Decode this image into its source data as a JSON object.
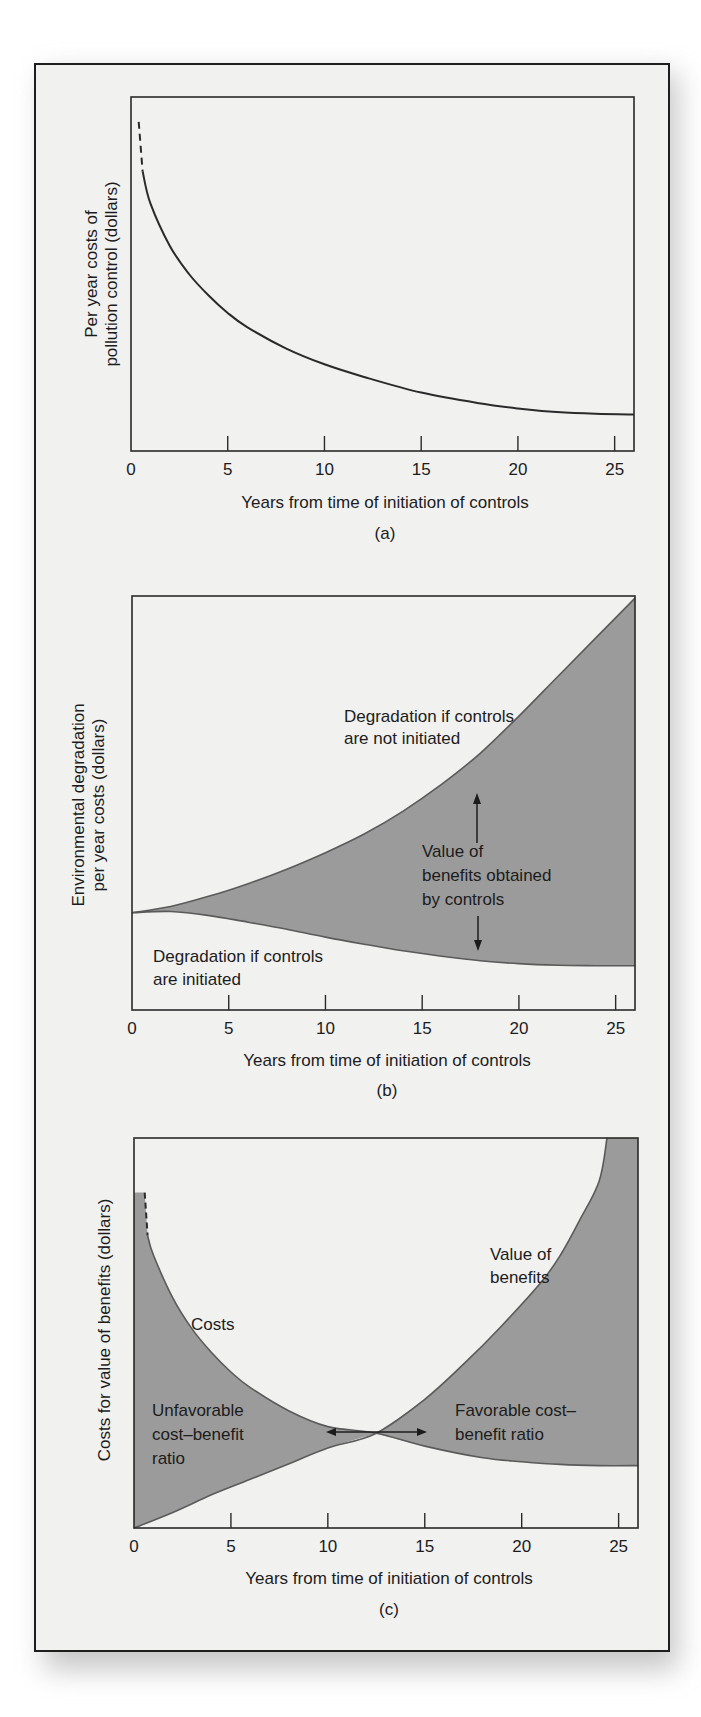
{
  "figure": {
    "background": "#f1f1f0",
    "fill_color": "#9b9b9b",
    "line_color": "#2a2a2a",
    "panels": [
      "(a)",
      "(b)",
      "(c)"
    ]
  },
  "chart_data": [
    {
      "type": "line",
      "panel": "(a)",
      "title": "",
      "xlabel": "Years from time of initiation of controls",
      "ylabel": [
        "Per year costs of",
        "pollution control (dollars)"
      ],
      "xticks": [
        0,
        5,
        10,
        15,
        20,
        25
      ],
      "xlim": [
        0,
        26
      ],
      "ylim": [
        0,
        100
      ],
      "grid": false,
      "caption": "(a)",
      "series": [
        {
          "name": "Per year costs of pollution control",
          "dashed_segment": {
            "x": [
              0.4,
              0.6
            ],
            "y": [
              93,
              79
            ]
          },
          "x": [
            0.6,
            1,
            2,
            3,
            4,
            5,
            6,
            8,
            10,
            12,
            15,
            18,
            20,
            22,
            24,
            26
          ],
          "y": [
            79,
            70,
            58,
            50,
            44,
            39,
            35,
            29,
            24.5,
            21,
            16.5,
            13.5,
            12,
            11,
            10.5,
            10.3
          ]
        }
      ]
    },
    {
      "type": "area",
      "panel": "(b)",
      "title": "",
      "xlabel": "Years from time of initiation of controls",
      "ylabel": [
        "Environmental degradation",
        "per year costs (dollars)"
      ],
      "xticks": [
        0,
        5,
        10,
        15,
        20,
        25
      ],
      "xlim": [
        0,
        26
      ],
      "ylim": [
        0,
        100
      ],
      "grid": false,
      "caption": "(b)",
      "series": [
        {
          "name": "Degradation if controls are not initiated",
          "x": [
            0,
            2,
            4,
            6,
            8,
            10,
            12,
            14,
            16,
            18,
            20,
            22,
            24,
            26
          ],
          "y": [
            23.5,
            25,
            27.5,
            30.5,
            34,
            38,
            42.5,
            48,
            54.5,
            62,
            71,
            80.5,
            90,
            99.5
          ]
        },
        {
          "name": "Degradation if controls are initiated",
          "x": [
            0,
            2,
            4,
            6,
            8,
            10,
            12,
            14,
            16,
            18,
            20,
            22,
            24,
            26
          ],
          "y": [
            23.5,
            23.8,
            22.8,
            21.2,
            19.5,
            17.6,
            15.9,
            14.3,
            13,
            11.9,
            11.2,
            10.8,
            10.7,
            10.7
          ]
        }
      ],
      "annotations": [
        {
          "text": [
            "Degradation if controls",
            "are not initiated"
          ]
        },
        {
          "text": [
            "Value of",
            "benefits obtained",
            "by controls"
          ]
        },
        {
          "text": [
            "Degradation if controls",
            "are initiated"
          ]
        }
      ]
    },
    {
      "type": "area",
      "panel": "(c)",
      "title": "",
      "xlabel": "Years from time of initiation of controls",
      "ylabel": [
        "Costs for value of benefits (dollars)"
      ],
      "xticks": [
        0,
        5,
        10,
        15,
        20,
        25
      ],
      "xlim": [
        0,
        26
      ],
      "ylim": [
        0,
        100
      ],
      "grid": false,
      "caption": "(c)",
      "series": [
        {
          "name": "Costs",
          "dashed_segment": {
            "x": [
              0.55,
              0.7
            ],
            "y": [
              86,
              75
            ]
          },
          "x": [
            0.7,
            1,
            2,
            3,
            4,
            5,
            6,
            8,
            10,
            12.5,
            15,
            18,
            20,
            22,
            24,
            26
          ],
          "y": [
            75,
            70,
            59,
            51,
            45,
            40,
            36,
            30,
            26,
            24.3,
            21,
            18,
            17,
            16.3,
            16,
            16
          ]
        },
        {
          "name": "Value of benefits",
          "x": [
            0,
            2,
            4,
            6,
            8,
            10,
            12.5,
            15,
            17,
            19,
            21,
            22,
            23,
            24,
            24.4
          ],
          "y": [
            0,
            4,
            8.5,
            12.5,
            16.5,
            20.5,
            24.3,
            33,
            42,
            52,
            63,
            70,
            79,
            89,
            100
          ]
        }
      ],
      "crossover_year": 12.5,
      "annotations": [
        {
          "text": [
            "Costs"
          ]
        },
        {
          "text": [
            "Value of",
            "benefits"
          ]
        },
        {
          "text": [
            "Unfavorable",
            "cost–benefit",
            "ratio"
          ]
        },
        {
          "text": [
            "Favorable cost–",
            "benefit ratio"
          ]
        }
      ]
    }
  ]
}
